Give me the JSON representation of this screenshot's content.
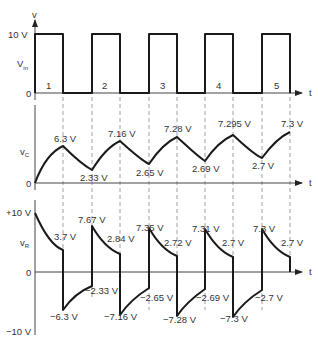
{
  "figure": {
    "panels": [
      {
        "name": "input",
        "ylabel": "V",
        "ylabel_sub": "in",
        "axis_top_label": "v",
        "ytick_top": "10 V",
        "ytick_zero": "0",
        "xlabel": "t",
        "pulse_numbers": [
          "1",
          "2",
          "3",
          "4",
          "5"
        ]
      },
      {
        "name": "capacitor",
        "ylabel": "v",
        "ylabel_sub": "C",
        "ytick_zero": "0",
        "xlabel": "t",
        "peaks": [
          "6.3 V",
          "7.16 V",
          "7.28 V",
          "7.295 V",
          "7.3 V"
        ],
        "troughs": [
          "2.33 V",
          "2.65 V",
          "2.69 V",
          "2.7 V"
        ]
      },
      {
        "name": "resistor",
        "ylabel": "v",
        "ylabel_sub": "R",
        "ytick_top": "+10 V",
        "ytick_zero": "0",
        "ytick_bottom": "−10 V",
        "xlabel": "t",
        "pos_peaks": [
          "7.67 V",
          "7.35 V",
          "7.31 V",
          "7.3 V"
        ],
        "pos_ends": [
          "3.7 V",
          "2.84 V",
          "2.72 V",
          "2.7 V",
          "2.7 V"
        ],
        "neg_peaks": [
          "−6.3 V",
          "−7.16 V",
          "−7.28 V",
          "−7.3 V"
        ],
        "neg_ends": [
          "−2.33 V",
          "−2.65 V",
          "−2.69 V",
          "−2.7 V"
        ]
      }
    ]
  }
}
